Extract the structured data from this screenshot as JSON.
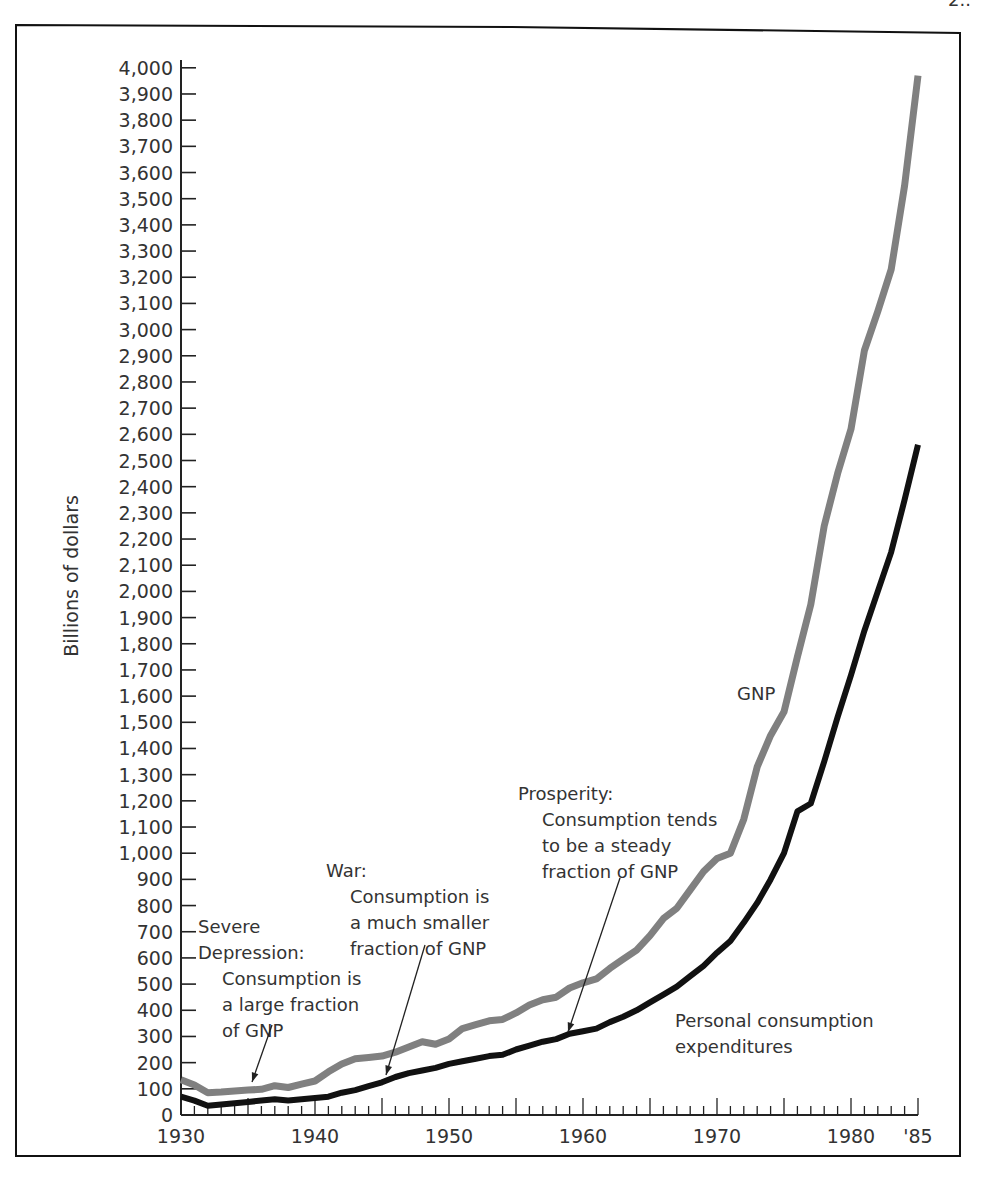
{
  "page_fragment": "2..",
  "chart_data": {
    "type": "line",
    "title": "",
    "xlabel": "",
    "ylabel": "Billions of dollars",
    "xlim": [
      1930,
      1985
    ],
    "ylim": [
      0,
      4000
    ],
    "x_tick_labels": [
      "1930",
      "1940",
      "1950",
      "1960",
      "1970",
      "1980",
      "'85"
    ],
    "x_tick_years": [
      1930,
      1940,
      1950,
      1960,
      1970,
      1980,
      1985
    ],
    "y_ticks": [
      0,
      100,
      200,
      300,
      400,
      500,
      600,
      700,
      800,
      900,
      1000,
      1100,
      1200,
      1300,
      1400,
      1500,
      1600,
      1700,
      1800,
      1900,
      2000,
      2100,
      2200,
      2300,
      2400,
      2500,
      2600,
      2700,
      2800,
      2900,
      3000,
      3100,
      3200,
      3300,
      3400,
      3500,
      3600,
      3700,
      3800,
      3900,
      4000
    ],
    "y_tick_labels": [
      "0",
      "100",
      "200",
      "300",
      "400",
      "500",
      "600",
      "700",
      "800",
      "900",
      "1,000",
      "1,100",
      "1,200",
      "1,300",
      "1,400",
      "1,500",
      "1,600",
      "1,700",
      "1,800",
      "1,900",
      "2,000",
      "2,100",
      "2,200",
      "2,300",
      "2,400",
      "2,500",
      "2,600",
      "2,700",
      "2,800",
      "2,900",
      "3,000",
      "3,100",
      "3,200",
      "3,300",
      "3,400",
      "3,500",
      "3,600",
      "3,700",
      "3,800",
      "3,900",
      "4,000"
    ],
    "grid": false,
    "legend": "inline labels",
    "x": [
      1930,
      1931,
      1932,
      1933,
      1934,
      1935,
      1936,
      1937,
      1938,
      1939,
      1940,
      1941,
      1942,
      1943,
      1944,
      1945,
      1946,
      1947,
      1948,
      1949,
      1950,
      1951,
      1952,
      1953,
      1954,
      1955,
      1956,
      1957,
      1958,
      1959,
      1960,
      1961,
      1962,
      1963,
      1964,
      1965,
      1966,
      1967,
      1968,
      1969,
      1970,
      1971,
      1972,
      1973,
      1974,
      1975,
      1976,
      1977,
      1978,
      1979,
      1980,
      1981,
      1982,
      1983,
      1984,
      1985
    ],
    "series": [
      {
        "name": "GNP",
        "color": "#808080",
        "values": [
          135,
          115,
          85,
          88,
          92,
          95,
          98,
          112,
          105,
          118,
          130,
          165,
          195,
          215,
          220,
          225,
          240,
          260,
          280,
          270,
          290,
          330,
          345,
          360,
          365,
          390,
          420,
          440,
          450,
          485,
          505,
          520,
          560,
          595,
          630,
          685,
          750,
          790,
          860,
          930,
          980,
          1000,
          1130,
          1330,
          1450,
          1540,
          1750,
          1950,
          2250,
          2450,
          2620,
          2920,
          3070,
          3230,
          3550,
          3970
        ]
      },
      {
        "name": "Personal consumption expenditures",
        "color": "#111111",
        "values": [
          70,
          55,
          35,
          40,
          45,
          50,
          55,
          60,
          55,
          60,
          65,
          70,
          85,
          95,
          110,
          125,
          145,
          160,
          170,
          180,
          195,
          205,
          215,
          225,
          230,
          250,
          265,
          280,
          290,
          310,
          320,
          330,
          355,
          375,
          400,
          430,
          460,
          490,
          530,
          570,
          620,
          665,
          735,
          810,
          900,
          1000,
          1160,
          1190,
          1350,
          1520,
          1680,
          1850,
          2000,
          2150,
          2350,
          2560
        ]
      }
    ],
    "annotations": [
      {
        "id": "depression",
        "lines": [
          "Severe",
          "Depression:",
          "Consumption is",
          "a large fraction",
          "of GNP"
        ],
        "arrow_to": [
          1935,
          50
        ]
      },
      {
        "id": "war",
        "lines": [
          "War:",
          "Consumption is",
          "a much smaller",
          "fraction of GNP"
        ],
        "arrow_to": [
          1945,
          125
        ]
      },
      {
        "id": "prosperity",
        "lines": [
          "Prosperity:",
          "Consumption tends",
          "to be a steady",
          "fraction of GNP"
        ],
        "arrow_to": [
          1958,
          290
        ]
      },
      {
        "id": "gnp_label",
        "lines": [
          "GNP"
        ]
      },
      {
        "id": "pce_label",
        "lines": [
          "Personal consumption",
          "expenditures"
        ]
      }
    ]
  }
}
